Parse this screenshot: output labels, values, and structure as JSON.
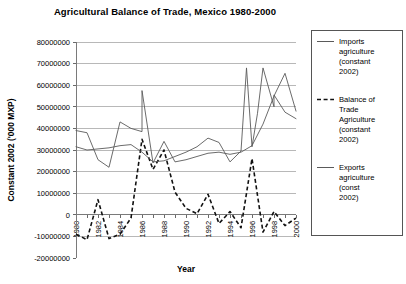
{
  "chart_data": {
    "type": "line",
    "title": "Agricultural Balance of Trade, Mexico 1980-2000",
    "xlabel": "Year",
    "ylabel": "Constant 2002 ('000 MXP)",
    "ylim": [
      -20000000,
      80000000
    ],
    "ytick_values": [
      80000000,
      70000000,
      60000000,
      50000000,
      40000000,
      30000000,
      20000000,
      10000000,
      0,
      -10000000,
      -20000000
    ],
    "ytick_labels": [
      "80000000",
      "70000000",
      "60000000",
      "50000000",
      "40000000",
      "30000000",
      "20000000",
      "10000000",
      "0",
      "-10000000",
      "-20000000"
    ],
    "xlim": [
      1980,
      2000
    ],
    "x": [
      1980,
      1981,
      1982,
      1983,
      1984,
      1985,
      1986,
      1987,
      1988,
      1989,
      1990,
      1991,
      1992,
      1993,
      1994,
      1995,
      1996,
      1997,
      1998,
      1999,
      2000
    ],
    "xtick_values": [
      1980,
      1982,
      1984,
      1986,
      1988,
      1990,
      1992,
      1994,
      1996,
      1998,
      2000
    ],
    "xtick_labels": [
      "1980",
      "1982",
      "1984",
      "1986",
      "1988",
      "1990",
      "1992",
      "1994",
      "1996",
      "1998",
      "2000"
    ],
    "grid": "horizontal",
    "legend_position": "right",
    "series": [
      {
        "name": "Imports agriculture (constant 2002)",
        "style": "solid",
        "color": "#5a5a5a",
        "values": [
          39000000,
          38000000,
          25500000,
          22000000,
          43000000,
          40000000,
          38500000,
          24000000,
          34000000,
          24500000,
          25500000,
          27000000,
          28500000,
          29000000,
          28000000,
          29000000,
          32000000,
          42000000,
          55000000,
          65500000,
          48000000
        ]
      },
      {
        "name": "Balance of Trade Agriculture (constant 2002)",
        "style": "dashed",
        "color": "#111111",
        "values": [
          -9000000,
          -11500000,
          7000000,
          -11000000,
          -9000000,
          -1500000,
          35000000,
          21000000,
          30000000,
          10500000,
          3000000,
          500000,
          9500000,
          -4000000,
          1500000,
          -6000000,
          26000000,
          -8000000,
          1500000,
          -5000000,
          -1500000
        ]
      },
      {
        "name": "Exports agriculture (const 2002)",
        "style": "solid",
        "color": "#5a5a5a",
        "values": [
          31500000,
          30000000,
          30500000,
          31000000,
          32000000,
          32500000,
          29000000,
          24500000,
          25000000,
          27000000,
          29000000,
          31500000,
          35500000,
          33500000,
          24500000,
          29500000,
          31500000,
          68000000,
          50000000,
          47500000,
          44500000
        ]
      }
    ],
    "series2_detail": {
      "imports_extra": [
        [
          1986.0,
          57500000
        ]
      ],
      "exports_extra": [
        [
          1995.5,
          68000000
        ],
        [
          1996.5,
          47000000
        ],
        [
          1998.0,
          55500000
        ]
      ]
    }
  },
  "legend": {
    "items": [
      {
        "label_lines": [
          "Imports",
          "agriculture",
          "(constant",
          "2002)"
        ],
        "style": "solid"
      },
      {
        "label_lines": [
          "Balance of",
          "Trade",
          "Agriculture",
          "(constant",
          "2002)"
        ],
        "style": "dashed"
      },
      {
        "label_lines": [
          "Exports",
          "agriculture",
          "(const",
          "2002)"
        ],
        "style": "solid"
      }
    ]
  },
  "colors": {
    "background": "#ffffff",
    "grid": "#9a9a9a",
    "axis": "#7a7a7a",
    "solid_series": "#5a5a5a",
    "dashed_series": "#111111"
  }
}
